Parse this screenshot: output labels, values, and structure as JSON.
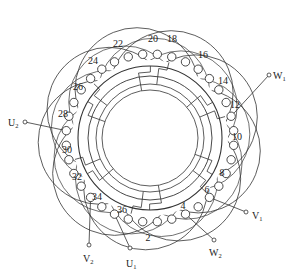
{
  "diagram": {
    "type": "motor-stator-winding",
    "slot_count": 36,
    "center": [
      150,
      138
    ],
    "stroke_color": "#333333",
    "background": "#ffffff",
    "slot_labels": [
      "2",
      "4",
      "6",
      "8",
      "10",
      "12",
      "14",
      "16",
      "18",
      "20",
      "22",
      "24",
      "26",
      "28",
      "30",
      "32",
      "34",
      "36"
    ],
    "labeled_slots": [
      {
        "label": "2",
        "x": 148,
        "y": 241
      },
      {
        "label": "4",
        "x": 183,
        "y": 209
      },
      {
        "label": "6",
        "x": 207,
        "y": 193
      },
      {
        "label": "8",
        "x": 222,
        "y": 176
      },
      {
        "label": "10",
        "x": 237,
        "y": 140
      },
      {
        "label": "12",
        "x": 235,
        "y": 108
      },
      {
        "label": "14",
        "x": 223,
        "y": 84
      },
      {
        "label": "16",
        "x": 203,
        "y": 58
      },
      {
        "label": "18",
        "x": 172,
        "y": 42
      },
      {
        "label": "20",
        "x": 153,
        "y": 42
      },
      {
        "label": "22",
        "x": 118,
        "y": 47
      },
      {
        "label": "24",
        "x": 93,
        "y": 64
      },
      {
        "label": "26",
        "x": 78,
        "y": 90
      },
      {
        "label": "28",
        "x": 63,
        "y": 117
      },
      {
        "label": "30",
        "x": 67,
        "y": 153
      },
      {
        "label": "32",
        "x": 77,
        "y": 180
      },
      {
        "label": "34",
        "x": 97,
        "y": 200
      },
      {
        "label": "36",
        "x": 122,
        "y": 213
      }
    ],
    "terminals": [
      {
        "id": "U1",
        "letter": "U",
        "sub": "1",
        "x": 130,
        "y": 248,
        "lx": 126,
        "ly": 267,
        "from_slot": 36
      },
      {
        "id": "U2",
        "letter": "U",
        "sub": "2",
        "x": 25,
        "y": 122,
        "lx": 8,
        "ly": 126,
        "from_slot": 29
      },
      {
        "id": "V1",
        "letter": "V",
        "sub": "1",
        "x": 246,
        "y": 212,
        "lx": 252,
        "ly": 219,
        "from_slot": 7
      },
      {
        "id": "V2",
        "letter": "V",
        "sub": "2",
        "x": 89,
        "y": 245,
        "lx": 83,
        "ly": 262,
        "from_slot": 34
      },
      {
        "id": "W1",
        "letter": "W",
        "sub": "1",
        "x": 269,
        "y": 75,
        "lx": 273,
        "ly": 79,
        "from_slot": 13
      },
      {
        "id": "W2",
        "letter": "W",
        "sub": "2",
        "x": 214,
        "y": 240,
        "lx": 209,
        "ly": 256,
        "from_slot": 5
      }
    ],
    "rings": {
      "outer_core_radius": 72,
      "inner_core_radius": 62,
      "bore_radius": 48,
      "slot_radius": 84
    },
    "coil_arcs": {
      "count": 9,
      "radius": 62
    }
  }
}
